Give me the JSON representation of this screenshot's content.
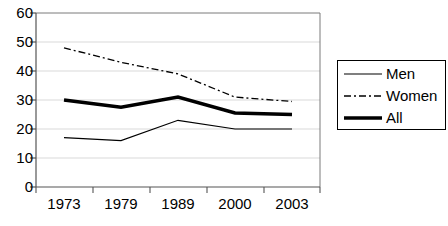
{
  "chart_data": {
    "type": "line",
    "title": "",
    "subtitle": "",
    "xlabel": "",
    "ylabel": "",
    "categories": [
      "1973",
      "1979",
      "1989",
      "2000",
      "2003"
    ],
    "series": [
      {
        "name": "Men",
        "values": [
          17,
          16,
          23,
          20,
          20
        ],
        "style": "solid-thin",
        "color": "#000000"
      },
      {
        "name": "Women",
        "values": [
          48,
          43,
          39,
          31,
          29.5
        ],
        "style": "dash-dot",
        "color": "#000000"
      },
      {
        "name": "All",
        "values": [
          30,
          27.5,
          31,
          25.5,
          25
        ],
        "style": "solid-thick",
        "color": "#000000"
      }
    ],
    "ylim": [
      0,
      60
    ],
    "yticks": [
      0,
      10,
      20,
      30,
      40,
      50,
      60
    ],
    "ytick_labels": [
      "0",
      "10",
      "20",
      "30",
      "40",
      "50",
      "60"
    ],
    "xtick_labels": [
      "1973",
      "1979",
      "1989",
      "2000",
      "2003"
    ],
    "grid": "horizontal",
    "legend_position": "right",
    "legend_entries": [
      "Men",
      "Women",
      "All"
    ]
  },
  "axes": {
    "y_labels": [
      "60",
      "50",
      "40",
      "30",
      "20",
      "10",
      "0"
    ],
    "x_labels": [
      "1973",
      "1979",
      "1989",
      "2000",
      "2003"
    ]
  },
  "legend": {
    "items": [
      {
        "label": "Men"
      },
      {
        "label": "Women"
      },
      {
        "label": "All"
      }
    ]
  }
}
